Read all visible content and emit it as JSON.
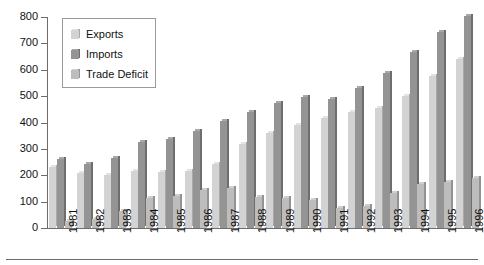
{
  "chart_data": {
    "type": "bar",
    "title": "",
    "subtitle": "",
    "xlabel": "",
    "ylabel": "",
    "categories": [
      "1981",
      "1982",
      "1983",
      "1984",
      "1985",
      "1986",
      "1987",
      "1988",
      "1989",
      "1990",
      "1991",
      "1992",
      "1993",
      "1994",
      "1995",
      "1996"
    ],
    "series": [
      {
        "name": "Exports",
        "values": [
          233,
          208,
          202,
          217,
          213,
          217,
          243,
          320,
          362,
          389,
          416,
          440,
          456,
          502,
          575,
          640
        ]
      },
      {
        "name": "Imports",
        "values": [
          261,
          244,
          266,
          328,
          336,
          368,
          406,
          441,
          473,
          495,
          488,
          532,
          589,
          669,
          743,
          803
        ]
      },
      {
        "name": "Trade Deficit",
        "values": [
          28,
          36,
          64,
          112,
          122,
          145,
          152,
          118,
          115,
          108,
          74,
          84,
          132,
          166,
          174,
          191
        ]
      }
    ],
    "ylim": [
      0,
      800
    ],
    "yticks": [
      0,
      100,
      200,
      300,
      400,
      500,
      600,
      700,
      800
    ],
    "ytick_labels": [
      "0",
      "100",
      "200",
      "300",
      "400",
      "500",
      "600",
      "700",
      "800"
    ],
    "grid": false,
    "legend_position": "top-left",
    "legend_entries": [
      "Exports",
      "Imports",
      "Trade Deficit"
    ],
    "annotations": []
  },
  "legend": {
    "entries": [
      {
        "label": "Exports",
        "swatch": "exports-swatch-icon"
      },
      {
        "label": "Imports",
        "swatch": "imports-swatch-icon"
      },
      {
        "label": "Trade Deficit",
        "swatch": "trade-deficit-swatch-icon"
      }
    ]
  },
  "colors": {
    "exports": "#d3d3d3",
    "imports": "#949494",
    "trade_deficit": "#bdbdbd",
    "axis": "#6d6d6d",
    "text": "#111111",
    "background": "#ffffff"
  }
}
